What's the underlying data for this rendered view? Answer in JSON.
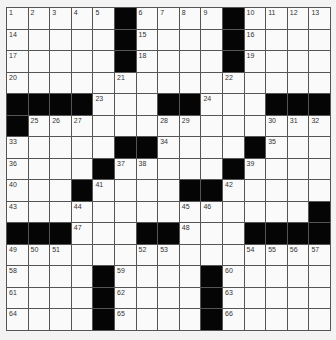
{
  "puzzle": {
    "rows": 15,
    "cols": 15,
    "colors": {
      "black": "#050505",
      "white": "#fafafa",
      "line": "#555555",
      "background": "#f3f3f3"
    },
    "grid": [
      [
        "1",
        "2",
        "3",
        "4",
        "5",
        "#",
        "6",
        "7",
        "8",
        "9",
        "#",
        "10",
        "11",
        "12",
        "13"
      ],
      [
        "14",
        "",
        "",
        "",
        "",
        "#",
        "15",
        "",
        "",
        "",
        "#",
        "16",
        "",
        "",
        ""
      ],
      [
        "17",
        "",
        "",
        "",
        "",
        "#",
        "18",
        "",
        "",
        "",
        "#",
        "19",
        "",
        "",
        ""
      ],
      [
        "20",
        "",
        "",
        "",
        "",
        "21",
        "",
        "",
        "",
        "",
        "22",
        "",
        "",
        "",
        ""
      ],
      [
        "#",
        "#",
        "#",
        "#",
        "23",
        "",
        "",
        "#",
        "#",
        "24",
        "",
        "",
        "#",
        "#",
        "#"
      ],
      [
        "#",
        "25",
        "26",
        "27",
        "",
        "",
        "",
        "28",
        "29",
        "",
        "",
        "",
        "30",
        "31",
        "32"
      ],
      [
        "33",
        "",
        "",
        "",
        "",
        "#",
        "#",
        "34",
        "",
        "",
        "",
        "#",
        "35",
        "",
        ""
      ],
      [
        "36",
        "",
        "",
        "",
        "#",
        "37",
        "38",
        "",
        "",
        "",
        "#",
        "39",
        "",
        "",
        ""
      ],
      [
        "40",
        "",
        "",
        "#",
        "41",
        "",
        "",
        "",
        "#",
        "#",
        "42",
        "",
        "",
        "",
        ""
      ],
      [
        "43",
        "",
        "",
        "44",
        "",
        "",
        "",
        "",
        "45",
        "46",
        "",
        "",
        "",
        "",
        "#"
      ],
      [
        "#",
        "#",
        "#",
        "47",
        "",
        "",
        "#",
        "#",
        "48",
        "",
        "",
        "#",
        "#",
        "#",
        "#"
      ],
      [
        "49",
        "50",
        "51",
        "",
        "",
        "",
        "52",
        "53",
        "",
        "",
        "",
        "54",
        "55",
        "56",
        "57"
      ],
      [
        "58",
        "",
        "",
        "",
        "#",
        "59",
        "",
        "",
        "",
        "#",
        "60",
        "",
        "",
        "",
        ""
      ],
      [
        "61",
        "",
        "",
        "",
        "#",
        "62",
        "",
        "",
        "",
        "#",
        "63",
        "",
        "",
        "",
        ""
      ],
      [
        "64",
        "",
        "",
        "",
        "#",
        "65",
        "",
        "",
        "",
        "#",
        "66",
        "",
        "",
        "",
        ""
      ]
    ]
  }
}
